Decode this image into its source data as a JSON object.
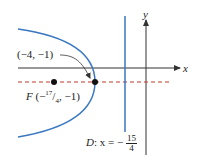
{
  "diagram": {
    "type": "parabola-focus-directrix",
    "colors": {
      "curve": "#3a78c2",
      "directrix": "#3a78c2",
      "axis_of_symmetry": "#c0392b",
      "axes": "#333333",
      "points": "#111111"
    },
    "axes": {
      "x_label": "x",
      "y_label": "y"
    },
    "vertex": {
      "label": "(−4, −1)"
    },
    "focus": {
      "prefix": "F",
      "label_open": "(−",
      "frac_num": "17",
      "frac_den": "4",
      "label_close": ", −1)"
    },
    "directrix": {
      "prefix": "D",
      "equation_lhs": ": x = −",
      "frac_num": "15",
      "frac_den": "4"
    }
  }
}
